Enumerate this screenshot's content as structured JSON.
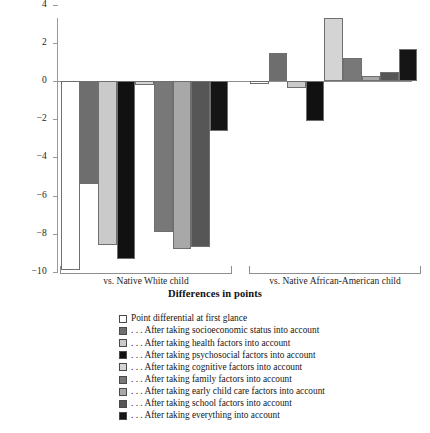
{
  "chart_data": {
    "type": "bar",
    "title": "",
    "xlabel": "Differences in points",
    "ylabel": "",
    "ylim": [
      -10,
      4
    ],
    "yticks": [
      4,
      2,
      0,
      -2,
      -4,
      -6,
      -8,
      -10
    ],
    "ytick_labels": [
      "4",
      "2",
      "0",
      "−2",
      "−4",
      "−6",
      "−8",
      "−10"
    ],
    "grid": false,
    "legend_position": "below",
    "categories": [
      "vs. Native White child",
      "vs. Native African-American child"
    ],
    "series": [
      {
        "name": "Point differential at first glance",
        "color": "#ffffff",
        "values": [
          -9.9,
          -0.15
        ]
      },
      {
        "name": "... After taking socioeconomic status into account",
        "color": "#6e6e6e",
        "values": [
          -5.4,
          1.45
        ]
      },
      {
        "name": "... After taking health factors into account",
        "color": "#cacaca",
        "values": [
          -8.6,
          -0.35
        ]
      },
      {
        "name": "... After taking psychosocial factors into account",
        "color": "#111111",
        "values": [
          -9.3,
          -2.1
        ]
      },
      {
        "name": "... After taking cognitive factors into account",
        "color": "#d4d4d4",
        "values": [
          -0.2,
          3.3
        ]
      },
      {
        "name": "... After taking family factors into account",
        "color": "#787878",
        "values": [
          -7.9,
          1.2
        ]
      },
      {
        "name": "... After taking early child care factors into account",
        "color": "#a8a8a8",
        "values": [
          -8.8,
          0.25
        ]
      },
      {
        "name": "... After taking school factors into account",
        "color": "#565656",
        "values": [
          -8.7,
          0.45
        ]
      },
      {
        "name": "... After taking everything into account",
        "color": "#151515",
        "values": [
          -2.6,
          1.7
        ]
      }
    ]
  },
  "axis": {
    "xlabel": "Differences in points",
    "group_labels": [
      "vs. Native White child",
      "vs. Native African-American child"
    ],
    "ytick_labels": [
      "4",
      "2",
      "0",
      "−2",
      "−4",
      "−6",
      "−8",
      "−10"
    ]
  },
  "legend": {
    "items": [
      "Point differential at first glance",
      ". . . After taking socioeconomic status into account",
      ". . . After taking health factors into account",
      ". . . After taking psychosocial factors into account",
      ". . . After taking cognitive factors into account",
      ". . . After taking family factors into account",
      ". . . After taking early child care factors into account",
      ". . . After taking school factors into account",
      ". . . After taking everything into account"
    ]
  }
}
